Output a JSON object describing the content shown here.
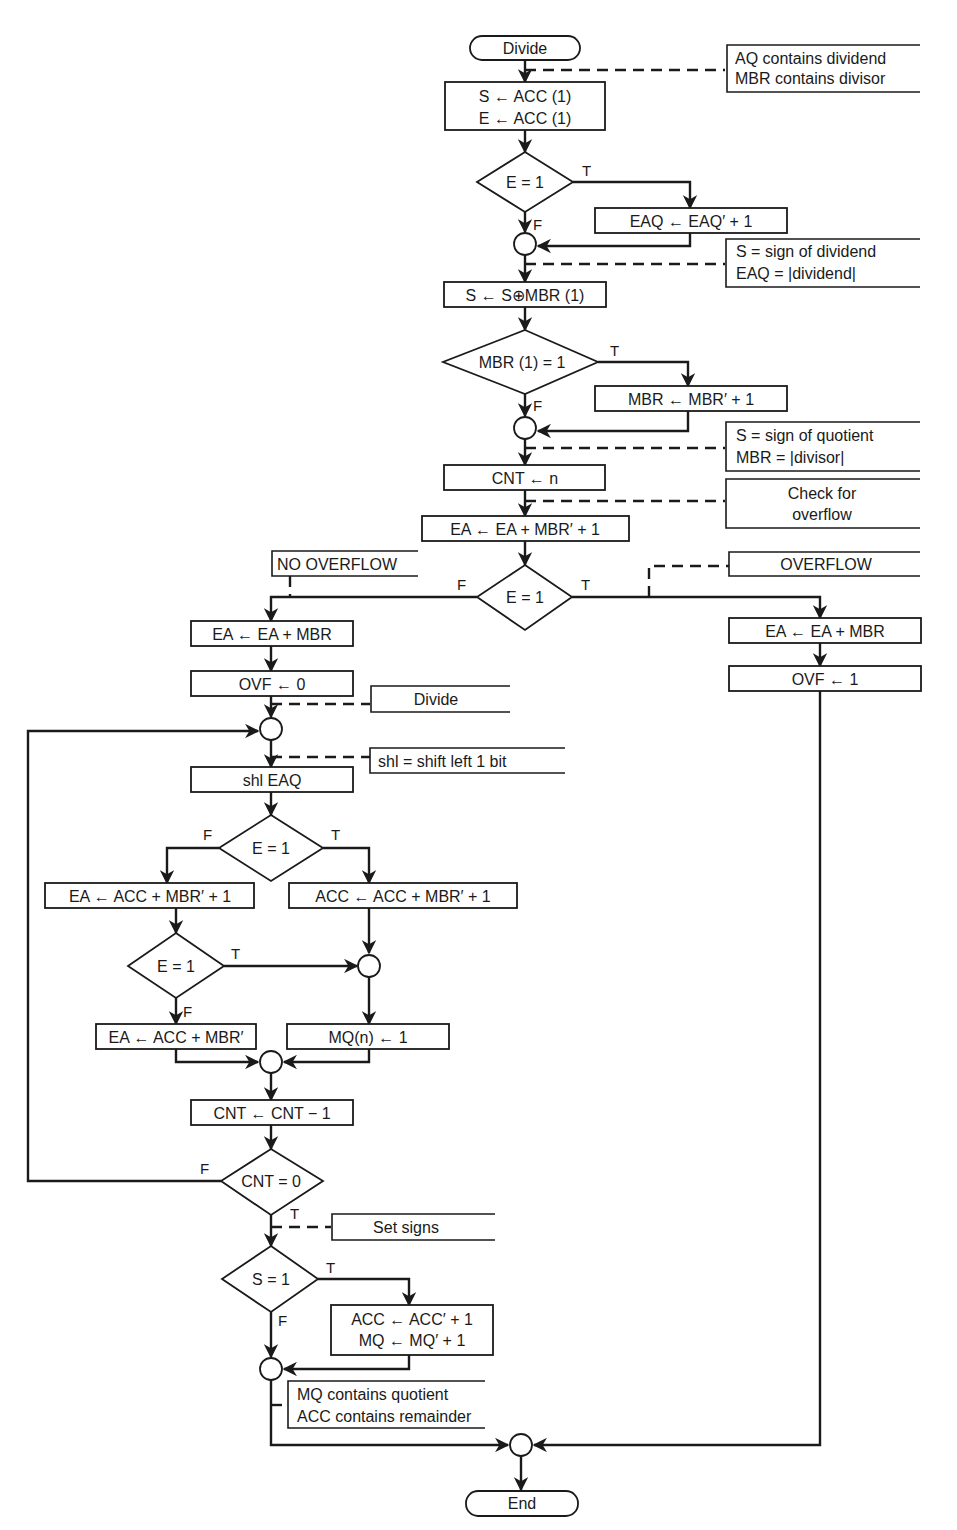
{
  "diagram": {
    "start": "Divide",
    "end": "End",
    "annotations": {
      "inputs": [
        "AQ contains dividend",
        "MBR contains divisor"
      ],
      "dividend_sign": [
        "S = sign of dividend",
        "EAQ = |dividend|"
      ],
      "quotient_sign": [
        "S = sign of quotient",
        "MBR = |divisor|"
      ],
      "check_overflow": [
        "Check for",
        "overflow"
      ],
      "no_overflow": "NO OVERFLOW",
      "overflow": "OVERFLOW",
      "divide": "Divide",
      "shl": "shl = shift left 1 bit",
      "set_signs": "Set signs",
      "result": [
        "MQ contains quotient",
        "ACC contains remainder"
      ]
    },
    "steps": {
      "init": [
        "S ← ACC (1)",
        "E ← ACC (1)"
      ],
      "dec_e1": "E = 1",
      "eaq_comp": "EAQ ← EAQ′ + 1",
      "s_xor": "S ← S⊕MBR (1)",
      "dec_mbr": "MBR (1) = 1",
      "mbr_comp": "MBR ← MBR′ + 1",
      "cnt_init": "CNT ← n",
      "ea_sub": "EA ← EA + MBR′ + 1",
      "dec_ovf": "E = 1",
      "restore_left": "EA ← EA + MBR",
      "ovf0": "OVF ← 0",
      "restore_right": "EA ← EA + MBR",
      "ovf1": "OVF ← 1",
      "shl": "shl EAQ",
      "dec_shift": "E = 1",
      "ea_acc_sub": "EA ← ACC + MBR′ + 1",
      "acc_sub": "ACC ← ACC + MBR′ + 1",
      "dec_e_inner": "E = 1",
      "ea_acc": "EA ← ACC + MBR′",
      "mq_set": "MQ(n) ← 1",
      "cnt_dec": "CNT ← CNT − 1",
      "dec_cnt": "CNT = 0",
      "dec_s": "S = 1",
      "negate": [
        "ACC ← ACC′ + 1",
        "MQ ← MQ′ + 1"
      ]
    },
    "branch_labels": {
      "true": "T",
      "false": "F"
    }
  }
}
